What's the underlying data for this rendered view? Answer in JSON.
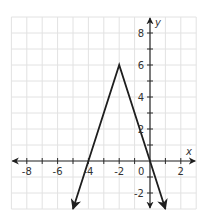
{
  "chart_data": {
    "type": "line",
    "title": "",
    "xlabel": "x",
    "ylabel": "y",
    "xlim": [
      -9,
      3
    ],
    "ylim": [
      -3,
      9
    ],
    "grid": true,
    "x_tick_labels": [
      "-8",
      "-6",
      "-4",
      "-2",
      "0",
      "2"
    ],
    "y_tick_labels": [
      "8",
      "6",
      "4",
      "2",
      "-2"
    ],
    "series": [
      {
        "name": "y = -3|x + 2| + 6",
        "x": [
          -5,
          -4,
          -2,
          0,
          1
        ],
        "y": [
          -3,
          0,
          6,
          0,
          -3
        ],
        "arrows_at_ends": true,
        "color": "#1e1e1e"
      }
    ],
    "vertex": [
      -2,
      6
    ],
    "x_intercepts": [
      -4,
      0
    ]
  },
  "labels": {
    "x_axis": "x",
    "y_axis": "y",
    "x_ticks": [
      {
        "v": -8,
        "t": "-8"
      },
      {
        "v": -6,
        "t": "-6"
      },
      {
        "v": -4,
        "t": "-4"
      },
      {
        "v": -2,
        "t": "-2"
      },
      {
        "v": 2,
        "t": "2"
      }
    ],
    "origin": "0",
    "y_ticks": [
      {
        "v": 8,
        "t": "8"
      },
      {
        "v": 6,
        "t": "6"
      },
      {
        "v": 4,
        "t": "4"
      },
      {
        "v": 2,
        "t": "2"
      },
      {
        "v": -2,
        "t": "-2"
      }
    ]
  },
  "colors": {
    "grid": "#e2e2e2",
    "axis": "#2a2a2a",
    "graph": "#1e1e1e"
  }
}
